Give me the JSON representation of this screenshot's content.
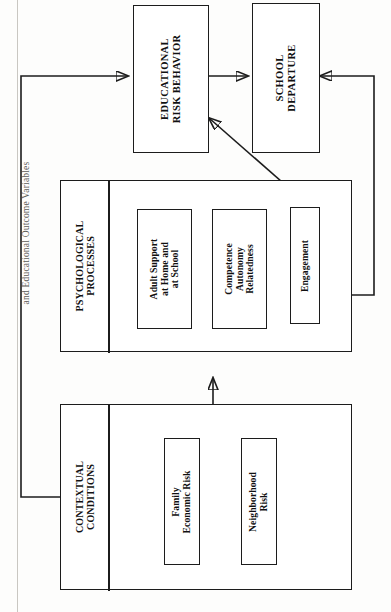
{
  "figure": {
    "caption": "and Educational Outcome Variables",
    "orientation": "rotated-90",
    "type": "conceptual-model-flow-diagram"
  },
  "nodes": {
    "educational_risk_behavior": {
      "label": "EDUCATIONAL\nRISK BEHAVIOR",
      "line1": "EDUCATIONAL",
      "line2": "RISK BEHAVIOR"
    },
    "school_departure": {
      "label": "SCHOOL\nDEPARTURE",
      "line1": "SCHOOL",
      "line2": "DEPARTURE"
    },
    "psychological_processes": {
      "line1": "PSYCHOLOGICAL",
      "line2": "PROCESSES"
    },
    "contextual_conditions": {
      "line1": "CONTEXTUAL",
      "line2": "CONDITIONS"
    },
    "adult_support": {
      "line1": "Adult Support",
      "line2": "at Home and",
      "line3": "at School"
    },
    "competence": {
      "line1": "Competence",
      "line2": "Autonomy",
      "line3": "Relatedness"
    },
    "engagement": {
      "line1": "Engagement"
    },
    "family_economic_risk": {
      "line1": "Family",
      "line2": "Economic Risk"
    },
    "neighborhood_risk": {
      "line1": "Neighborhood",
      "line2": "Risk"
    }
  },
  "colors": {
    "stroke": "#1c1c1c",
    "background": "#fdfdfc",
    "caption_text": "#5e5c58"
  },
  "edges": [
    {
      "name": "contextual-to-psychological",
      "from": "contextual_conditions",
      "to": "psychological_processes",
      "style": "solid-arrow"
    },
    {
      "name": "adult-support-to-competence",
      "from": "adult_support",
      "to": "competence",
      "style": "solid-arrow"
    },
    {
      "name": "competence-to-engagement",
      "from": "competence",
      "to": "engagement",
      "style": "solid-arrow"
    },
    {
      "name": "engagement-feedback-to-adult-support",
      "from": "engagement",
      "to": "adult_support",
      "style": "solid-arrow-elbow"
    },
    {
      "name": "engagement-to-educational-risk-behavior",
      "from": "engagement",
      "to": "educational_risk_behavior",
      "style": "diagonal-arrow"
    },
    {
      "name": "educational-risk-behavior-to-school-departure",
      "from": "educational_risk_behavior",
      "to": "school_departure",
      "style": "solid-arrow"
    },
    {
      "name": "contextual-to-educational-risk-behavior",
      "from": "contextual_conditions",
      "to": "educational_risk_behavior",
      "style": "solid-arrow-elbow"
    },
    {
      "name": "psychological-to-school-departure",
      "from": "psychological_processes",
      "to": "school_departure",
      "style": "solid-arrow-elbow"
    }
  ]
}
